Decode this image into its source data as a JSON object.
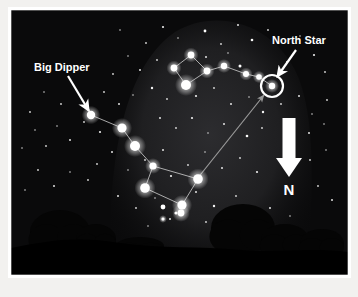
{
  "figure": {
    "canvas": {
      "width": 358,
      "height": 297
    },
    "border": {
      "color": "#ffffff",
      "inset_left": 11,
      "inset_top": 10,
      "inner_width": 337,
      "inner_height": 265
    },
    "colors": {
      "page_background": "#f2f1ef",
      "sky_dark": "#080808",
      "sky_mid": "#141414",
      "milky_way_glow": "#262628",
      "star_white": "#ffffff",
      "constellation_line": "#d8d8d8",
      "pointer_line": "#9a9a9a",
      "ground": "#000000",
      "tree": "#050505",
      "label_text": "#ffffff",
      "arrow_white": "#ffffff"
    }
  },
  "labels": {
    "big_dipper": {
      "text": "Big Dipper",
      "x": 34,
      "y": 71,
      "font_size": 11,
      "anchor": "start"
    },
    "north_star": {
      "text": "North Star",
      "x": 272,
      "y": 44,
      "font_size": 11,
      "anchor": "start"
    },
    "north_direction": {
      "text": "N",
      "x": 289,
      "y": 195,
      "font_size": 15,
      "anchor": "middle"
    }
  },
  "annotations": {
    "big_dipper_arrow": {
      "x1": 68,
      "y1": 76,
      "x2": 89,
      "y2": 111,
      "width": 2.2
    },
    "north_star_arrow": {
      "x1": 296,
      "y1": 50,
      "x2": 277,
      "y2": 77,
      "width": 2.2
    },
    "pointer_line": {
      "x1": 197,
      "y1": 179,
      "x2": 264,
      "y2": 95,
      "width": 1.2,
      "note": "pointer stars to Polaris"
    },
    "north_arrow": {
      "shaft_x": 289,
      "shaft_top": 118,
      "shaft_bottom": 158,
      "shaft_width": 13,
      "head_half_width": 13,
      "head_tip_y": 177
    }
  },
  "chart_data": {
    "type": "scatter",
    "xlabel": "",
    "ylabel": "",
    "xlim": [
      11,
      348
    ],
    "ylim": [
      10,
      275
    ],
    "grid": false,
    "legend": null,
    "annotations": [
      "Big Dipper",
      "North Star",
      "N"
    ],
    "constellations": [
      {
        "name": "Big Dipper",
        "stars": [
          {
            "id": "alkaid",
            "x": 91,
            "y": 115,
            "r": 4.2
          },
          {
            "id": "mizar",
            "x": 122,
            "y": 128,
            "r": 4.6
          },
          {
            "id": "alioth",
            "x": 135,
            "y": 146,
            "r": 5.0
          },
          {
            "id": "megrez",
            "x": 153,
            "y": 166,
            "r": 3.6
          },
          {
            "id": "dubhe",
            "x": 198,
            "y": 179,
            "r": 4.8
          },
          {
            "id": "merak",
            "x": 145,
            "y": 188,
            "r": 4.8
          },
          {
            "id": "phecda",
            "x": 182,
            "y": 205,
            "r": 4.6
          }
        ],
        "lines": [
          [
            "alkaid",
            "mizar"
          ],
          [
            "mizar",
            "alioth"
          ],
          [
            "alioth",
            "megrez"
          ],
          [
            "megrez",
            "dubhe"
          ],
          [
            "megrez",
            "merak"
          ],
          [
            "merak",
            "phecda"
          ],
          [
            "phecda",
            "dubhe"
          ]
        ]
      },
      {
        "name": "Little Dipper",
        "stars": [
          {
            "id": "kochab",
            "x": 186,
            "y": 85,
            "r": 5.0
          },
          {
            "id": "pherkad",
            "x": 174,
            "y": 68,
            "r": 3.4
          },
          {
            "id": "bowl3",
            "x": 191,
            "y": 55,
            "r": 3.4
          },
          {
            "id": "bowl4",
            "x": 207,
            "y": 71,
            "r": 3.4
          },
          {
            "id": "handle1",
            "x": 224,
            "y": 66,
            "r": 3.2
          },
          {
            "id": "handle2",
            "x": 246,
            "y": 74,
            "r": 3.0
          },
          {
            "id": "handle3",
            "x": 259,
            "y": 77,
            "r": 2.8
          },
          {
            "id": "polaris",
            "x": 272,
            "y": 86,
            "r": 3.2
          }
        ],
        "lines": [
          [
            "kochab",
            "pherkad"
          ],
          [
            "pherkad",
            "bowl3"
          ],
          [
            "bowl3",
            "bowl4"
          ],
          [
            "bowl4",
            "kochab"
          ],
          [
            "bowl4",
            "handle1"
          ],
          [
            "handle1",
            "handle2"
          ],
          [
            "handle2",
            "handle3"
          ],
          [
            "handle3",
            "polaris"
          ]
        ]
      }
    ],
    "highlight": {
      "name": "North Star (Polaris)",
      "x": 272,
      "y": 86,
      "ring_radius": 11,
      "ring_width": 2.2
    },
    "background_stars": [
      {
        "x": 120,
        "y": 30,
        "r": 0.8
      },
      {
        "x": 146,
        "y": 43,
        "r": 0.9
      },
      {
        "x": 163,
        "y": 27,
        "r": 1.1
      },
      {
        "x": 178,
        "y": 38,
        "r": 0.8
      },
      {
        "x": 205,
        "y": 31,
        "r": 1.4
      },
      {
        "x": 221,
        "y": 44,
        "r": 0.9
      },
      {
        "x": 238,
        "y": 25,
        "r": 1.0
      },
      {
        "x": 252,
        "y": 40,
        "r": 1.3
      },
      {
        "x": 268,
        "y": 30,
        "r": 0.9
      },
      {
        "x": 287,
        "y": 62,
        "r": 1.0
      },
      {
        "x": 300,
        "y": 36,
        "r": 0.8
      },
      {
        "x": 314,
        "y": 55,
        "r": 1.1
      },
      {
        "x": 325,
        "y": 72,
        "r": 0.9
      },
      {
        "x": 206,
        "y": 57,
        "r": 1.0
      },
      {
        "x": 228,
        "y": 53,
        "r": 0.8
      },
      {
        "x": 240,
        "y": 66,
        "r": 1.5
      },
      {
        "x": 157,
        "y": 60,
        "r": 0.9
      },
      {
        "x": 140,
        "y": 70,
        "r": 1.0
      },
      {
        "x": 128,
        "y": 56,
        "r": 0.8
      },
      {
        "x": 113,
        "y": 74,
        "r": 0.9
      },
      {
        "x": 152,
        "y": 88,
        "r": 1.2
      },
      {
        "x": 167,
        "y": 99,
        "r": 0.9
      },
      {
        "x": 133,
        "y": 95,
        "r": 0.8
      },
      {
        "x": 119,
        "y": 104,
        "r": 1.0
      },
      {
        "x": 104,
        "y": 92,
        "r": 0.9
      },
      {
        "x": 196,
        "y": 96,
        "r": 1.1
      },
      {
        "x": 214,
        "y": 88,
        "r": 0.9
      },
      {
        "x": 231,
        "y": 104,
        "r": 1.0
      },
      {
        "x": 249,
        "y": 97,
        "r": 0.8
      },
      {
        "x": 263,
        "y": 112,
        "r": 1.2
      },
      {
        "x": 281,
        "y": 104,
        "r": 0.9
      },
      {
        "x": 299,
        "y": 96,
        "r": 1.0
      },
      {
        "x": 312,
        "y": 114,
        "r": 0.8
      },
      {
        "x": 327,
        "y": 100,
        "r": 0.9
      },
      {
        "x": 160,
        "y": 118,
        "r": 1.0
      },
      {
        "x": 176,
        "y": 128,
        "r": 0.9
      },
      {
        "x": 192,
        "y": 118,
        "r": 1.1
      },
      {
        "x": 208,
        "y": 133,
        "r": 0.8
      },
      {
        "x": 224,
        "y": 124,
        "r": 1.0
      },
      {
        "x": 247,
        "y": 136,
        "r": 1.3
      },
      {
        "x": 262,
        "y": 128,
        "r": 0.9
      },
      {
        "x": 309,
        "y": 133,
        "r": 1.0
      },
      {
        "x": 324,
        "y": 124,
        "r": 0.8
      },
      {
        "x": 100,
        "y": 132,
        "r": 1.1
      },
      {
        "x": 84,
        "y": 122,
        "r": 0.9
      },
      {
        "x": 70,
        "y": 140,
        "r": 1.0
      },
      {
        "x": 57,
        "y": 126,
        "r": 0.8
      },
      {
        "x": 46,
        "y": 146,
        "r": 0.9
      },
      {
        "x": 35,
        "y": 130,
        "r": 0.8
      },
      {
        "x": 112,
        "y": 152,
        "r": 1.0
      },
      {
        "x": 97,
        "y": 164,
        "r": 0.9
      },
      {
        "x": 128,
        "y": 170,
        "r": 0.8
      },
      {
        "x": 145,
        "y": 160,
        "r": 0.9
      },
      {
        "x": 163,
        "y": 150,
        "r": 1.0
      },
      {
        "x": 171,
        "y": 176,
        "r": 1.1
      },
      {
        "x": 188,
        "y": 165,
        "r": 0.9
      },
      {
        "x": 205,
        "y": 152,
        "r": 0.8
      },
      {
        "x": 222,
        "y": 168,
        "r": 1.0
      },
      {
        "x": 240,
        "y": 158,
        "r": 0.9
      },
      {
        "x": 257,
        "y": 172,
        "r": 1.1
      },
      {
        "x": 310,
        "y": 160,
        "r": 0.9
      },
      {
        "x": 326,
        "y": 150,
        "r": 0.8
      },
      {
        "x": 88,
        "y": 180,
        "r": 0.9
      },
      {
        "x": 70,
        "y": 172,
        "r": 0.8
      },
      {
        "x": 54,
        "y": 186,
        "r": 1.0
      },
      {
        "x": 38,
        "y": 170,
        "r": 0.9
      },
      {
        "x": 25,
        "y": 190,
        "r": 0.8
      },
      {
        "x": 118,
        "y": 196,
        "r": 1.0
      },
      {
        "x": 136,
        "y": 208,
        "r": 0.9
      },
      {
        "x": 155,
        "y": 198,
        "r": 0.8
      },
      {
        "x": 196,
        "y": 192,
        "r": 1.0
      },
      {
        "x": 214,
        "y": 206,
        "r": 1.2
      },
      {
        "x": 236,
        "y": 196,
        "r": 0.9
      },
      {
        "x": 252,
        "y": 208,
        "r": 0.8
      },
      {
        "x": 318,
        "y": 186,
        "r": 0.9
      },
      {
        "x": 332,
        "y": 200,
        "r": 1.0
      },
      {
        "x": 30,
        "y": 112,
        "r": 0.9
      },
      {
        "x": 22,
        "y": 148,
        "r": 0.8
      },
      {
        "x": 44,
        "y": 92,
        "r": 0.8
      },
      {
        "x": 61,
        "y": 104,
        "r": 0.9
      },
      {
        "x": 170,
        "y": 219,
        "r": 1.0
      },
      {
        "x": 148,
        "y": 226,
        "r": 0.8
      },
      {
        "x": 206,
        "y": 222,
        "r": 0.9
      },
      {
        "x": 270,
        "y": 208,
        "r": 1.0
      },
      {
        "x": 290,
        "y": 216,
        "r": 0.8
      },
      {
        "x": 163,
        "y": 207,
        "r": 2.4
      },
      {
        "x": 176,
        "y": 213,
        "r": 1.6
      }
    ],
    "bright_foreground_stars": [
      {
        "x": 181,
        "y": 213,
        "r": 3.4
      },
      {
        "x": 163,
        "y": 219,
        "r": 1.5
      }
    ]
  },
  "scenery": {
    "milky_way": {
      "description": "large soft glow dome across upper sky",
      "path": "M 110 275 C 108 170, 120 70, 175 32 C 215 8, 270 22, 295 70 C 318 116, 312 200, 308 275 Z"
    },
    "horizon": {
      "description": "rolling dark ground silhouette",
      "path": "M 11 248 C 50 240, 78 236, 120 243 C 160 249, 200 246, 240 250 C 275 253, 310 247, 348 252 L 348 275 L 11 275 Z"
    },
    "trees": [
      {
        "name": "left-tree-large",
        "cx": 60,
        "cy": 232,
        "rx": 30,
        "ry": 22,
        "trunk_w": 4,
        "trunk_h": 22
      },
      {
        "name": "left-tree-small",
        "cx": 96,
        "cy": 239,
        "rx": 20,
        "ry": 15,
        "trunk_w": 3,
        "trunk_h": 14
      },
      {
        "name": "center-shrub",
        "cx": 140,
        "cy": 246,
        "rx": 24,
        "ry": 9,
        "trunk_w": 0,
        "trunk_h": 0
      },
      {
        "name": "right-tree-large",
        "cx": 243,
        "cy": 228,
        "rx": 32,
        "ry": 24,
        "trunk_w": 5,
        "trunk_h": 24
      },
      {
        "name": "right-tree-mid",
        "cx": 285,
        "cy": 240,
        "rx": 24,
        "ry": 16,
        "trunk_w": 4,
        "trunk_h": 16
      },
      {
        "name": "right-tree-small",
        "cx": 322,
        "cy": 243,
        "rx": 22,
        "ry": 14,
        "trunk_w": 3,
        "trunk_h": 14
      }
    ]
  }
}
